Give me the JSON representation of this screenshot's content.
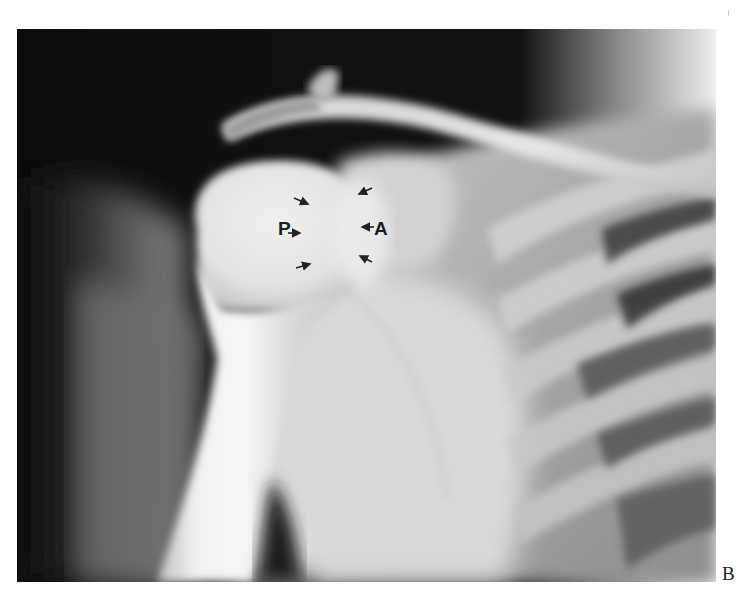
{
  "figure": {
    "type": "radiograph",
    "panel_label": "B",
    "annotations": {
      "posterior_label": "P",
      "anterior_label": "A",
      "arrow_count": 8
    },
    "colors": {
      "background": "#ffffff",
      "film_dark": "#0e0e0e",
      "bone_bright": "#ececec",
      "label_color": "#1e1e1e"
    }
  }
}
